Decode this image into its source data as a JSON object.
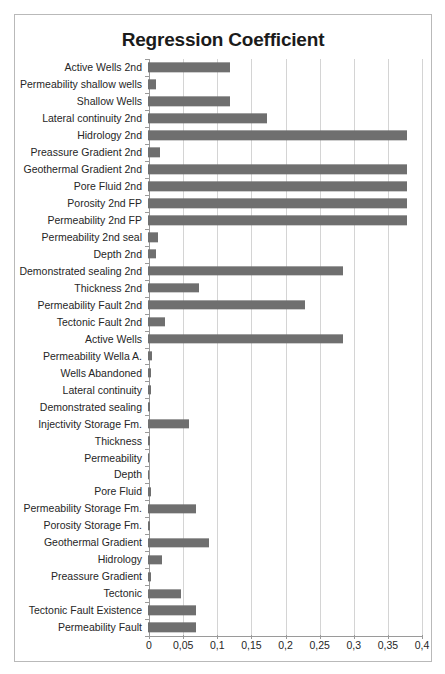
{
  "chart_data": {
    "type": "bar",
    "orientation": "horizontal",
    "title": "Regression Coefficient",
    "xlabel": "",
    "ylabel": "",
    "xlim": [
      0,
      0.4
    ],
    "grid": true,
    "legend": false,
    "bar_color": "#6f6f6f",
    "decimal_separator": ",",
    "xticks": [
      "0",
      "0,05",
      "0,1",
      "0,15",
      "0,2",
      "0,25",
      "0,3",
      "0,35",
      "0,4"
    ],
    "xtick_values": [
      0,
      0.05,
      0.1,
      0.15,
      0.2,
      0.25,
      0.3,
      0.35,
      0.4
    ],
    "categories": [
      "Active Wells 2nd",
      "Permeability shallow wells",
      "Shallow Wells",
      "Lateral continuity 2nd",
      "Hidrology 2nd",
      "Preassure Gradient 2nd",
      "Geothermal Gradient 2nd",
      "Pore Fluid 2nd",
      "Porosity 2nd FP",
      "Permeability 2nd FP",
      "Permeability 2nd seal",
      "Depth 2nd",
      "Demonstrated sealing 2nd",
      "Thickness 2nd",
      "Permeability Fault 2nd",
      "Tectonic Fault  2nd",
      "Active Wells",
      "Permeability Wella A.",
      "Wells Abandoned",
      "Lateral continuity",
      "Demonstrated sealing",
      "Injectivity Storage Fm.",
      "Thickness",
      "Permeability",
      "Depth",
      "Pore Fluid",
      "Permeability Storage Fm.",
      "Porosity Storage Fm.",
      "Geothermal Gradient",
      "Hidrology",
      "Preassure Gradient",
      "Tectonic",
      "Tectonic Fault  Existence",
      "Permeability Fault"
    ],
    "values": [
      0.12,
      0.012,
      0.12,
      0.175,
      0.38,
      0.018,
      0.38,
      0.38,
      0.38,
      0.38,
      0.014,
      0.012,
      0.285,
      0.075,
      0.23,
      0.025,
      0.285,
      0.006,
      0.004,
      0.004,
      0.003,
      0.06,
      0.003,
      0.002,
      0.002,
      0.005,
      0.07,
      0.003,
      0.09,
      0.02,
      0.005,
      0.048,
      0.07,
      0.07
    ]
  }
}
